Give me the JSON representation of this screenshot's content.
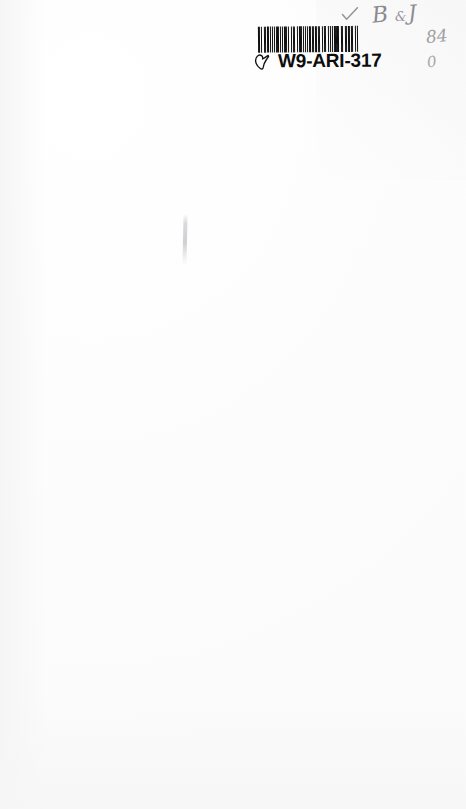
{
  "document": {
    "kind": "scanned-book-page",
    "page_background_color": "#ffffff",
    "ink_color": "#101010",
    "pencil_color": "#8c8c90",
    "content_description": "blank page"
  },
  "barcode_label": {
    "code_text": "W9-ARI-317",
    "pointer_icon_name": "pointing-hand-icon",
    "barcode_icon_name": "barcode-icon",
    "barcode_pattern": [
      3,
      2,
      1,
      3,
      2,
      1,
      1,
      2,
      3,
      1,
      2,
      1,
      1,
      3,
      2,
      1,
      1,
      1,
      3,
      2,
      1,
      2,
      2,
      1,
      3,
      1,
      1,
      2,
      1,
      3,
      2,
      1,
      2,
      1,
      1,
      3,
      1,
      2,
      3,
      1,
      1,
      2,
      2,
      1,
      1,
      3,
      1,
      2,
      3,
      1,
      2,
      1,
      1,
      2,
      3,
      1,
      1,
      1,
      2,
      3,
      1,
      2,
      1,
      1,
      2,
      2,
      3,
      1,
      1,
      2,
      1,
      3,
      2,
      1,
      1,
      1,
      3,
      2,
      1,
      2,
      1,
      3,
      1,
      1,
      2,
      1,
      3,
      2,
      1,
      1,
      2,
      3,
      1,
      2,
      1,
      3
    ]
  },
  "handwriting": {
    "checkmark": "✓",
    "initial_b": "B",
    "ampersand_mark": "&",
    "initial_j": "J",
    "number_84": "84",
    "number_0": "0"
  }
}
